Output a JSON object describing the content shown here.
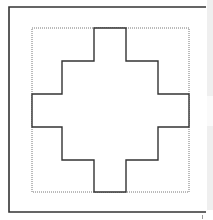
{
  "diagram": {
    "title": "",
    "frame": {
      "x1": 9,
      "y1": 7,
      "x2": 206,
      "y2": 212,
      "color": "#333333"
    },
    "bounding_box": {
      "x": 32,
      "y": 28,
      "width": 157,
      "height": 164,
      "style": "dotted",
      "color": "#777777"
    },
    "shape": {
      "name": "stepped-cross",
      "color": "#333333",
      "points": "94,28 126,28 126,61 158,61 158,94 189,94 189,127 158,127 158,160 126,160 126,192 94,192 94,160 62,160 62,127 32,127 32,94 62,94 62,61 94,61"
    }
  },
  "scrollbar": {
    "track_color": "#efefef",
    "thumb_color": "#fafafa"
  }
}
